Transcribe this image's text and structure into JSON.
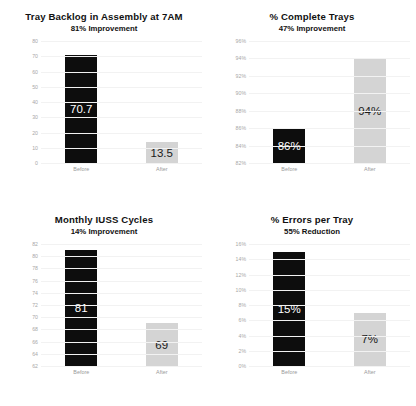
{
  "chart_data": [
    {
      "type": "bar",
      "title": "Tray Backlog in Assembly at 7AM",
      "subtitle": "81% Improvement",
      "xlabel": "",
      "ylabel": "",
      "categories": [
        "Before",
        "After"
      ],
      "values": [
        70.7,
        13.5
      ],
      "value_labels": [
        "70.7",
        "13.5"
      ],
      "ylim": [
        0,
        80
      ],
      "yticks": [
        "80",
        "70",
        "60",
        "50",
        "40",
        "30",
        "20",
        "10",
        "0"
      ],
      "ytick_values": [
        80,
        70,
        60,
        50,
        40,
        30,
        20,
        10,
        0
      ],
      "grid": true,
      "legend": "none",
      "colors": [
        "#0d0d0d",
        "#d4d4d4"
      ]
    },
    {
      "type": "bar",
      "title": "% Complete Trays",
      "subtitle": "47% Improvement",
      "xlabel": "",
      "ylabel": "",
      "categories": [
        "Before",
        "After"
      ],
      "values": [
        86,
        94
      ],
      "value_labels": [
        "86%",
        "94%"
      ],
      "ylim": [
        82,
        96
      ],
      "yticks": [
        "96%",
        "94%",
        "92%",
        "90%",
        "88%",
        "86%",
        "84%",
        "82%"
      ],
      "ytick_values": [
        96,
        94,
        92,
        90,
        88,
        86,
        84,
        82
      ],
      "grid": true,
      "legend": "none",
      "colors": [
        "#0d0d0d",
        "#d4d4d4"
      ]
    },
    {
      "type": "bar",
      "title": "Monthly IUSS Cycles",
      "subtitle": "14% Improvement",
      "xlabel": "",
      "ylabel": "",
      "categories": [
        "Before",
        "After"
      ],
      "values": [
        81,
        69
      ],
      "value_labels": [
        "81",
        "69"
      ],
      "ylim": [
        62,
        82
      ],
      "yticks": [
        "82",
        "80",
        "78",
        "76",
        "74",
        "72",
        "70",
        "68",
        "66",
        "64",
        "62"
      ],
      "ytick_values": [
        82,
        80,
        78,
        76,
        74,
        72,
        70,
        68,
        66,
        64,
        62
      ],
      "grid": true,
      "legend": "none",
      "colors": [
        "#0d0d0d",
        "#d4d4d4"
      ]
    },
    {
      "type": "bar",
      "title": "% Errors per Tray",
      "subtitle": "55% Reduction",
      "xlabel": "",
      "ylabel": "",
      "categories": [
        "Before",
        "After"
      ],
      "values": [
        15,
        7
      ],
      "value_labels": [
        "15%",
        "7%"
      ],
      "ylim": [
        0,
        16
      ],
      "yticks": [
        "16%",
        "14%",
        "12%",
        "10%",
        "8%",
        "6%",
        "4%",
        "2%",
        "0%"
      ],
      "ytick_values": [
        16,
        14,
        12,
        10,
        8,
        6,
        4,
        2,
        0
      ],
      "grid": true,
      "legend": "none",
      "colors": [
        "#0d0d0d",
        "#d4d4d4"
      ]
    }
  ]
}
